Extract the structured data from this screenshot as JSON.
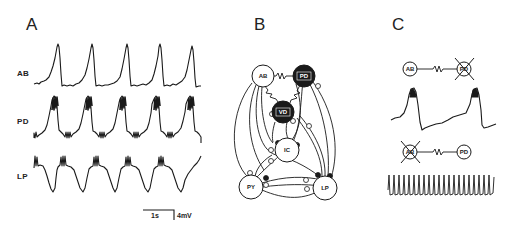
{
  "figure": {
    "panels": [
      {
        "id": "A",
        "label": "A"
      },
      {
        "id": "B",
        "label": "B"
      },
      {
        "id": "C",
        "label": "C"
      }
    ],
    "panel_a": {
      "traces": [
        {
          "label": "AB",
          "bursts": 5
        },
        {
          "label": "PD",
          "bursts": 5
        },
        {
          "label": "LP",
          "bursts": 5
        }
      ],
      "scale_bar": {
        "time": "1s",
        "voltage": "4mV"
      }
    },
    "panel_b": {
      "nodes": [
        {
          "label": "AB",
          "fill": "white"
        },
        {
          "label": "PD",
          "fill": "black"
        },
        {
          "label": "VD",
          "fill": "black"
        },
        {
          "label": "IC",
          "fill": "white"
        },
        {
          "label": "PY",
          "fill": "white"
        },
        {
          "label": "LP",
          "fill": "white"
        }
      ],
      "legend": {
        "electrical_coupling": "resistor-symbol",
        "inhibitory_synapse_open": "open-circle",
        "inhibitory_synapse_filled": "filled-circle"
      }
    },
    "panel_c": {
      "top_pair": {
        "left": "AB",
        "right": "PD",
        "removed": "PD"
      },
      "bottom_pair": {
        "left": "AB",
        "right": "PD",
        "removed": "AB"
      }
    }
  },
  "colors": {
    "ink": "#1a1a1a",
    "background": "#ffffff"
  }
}
